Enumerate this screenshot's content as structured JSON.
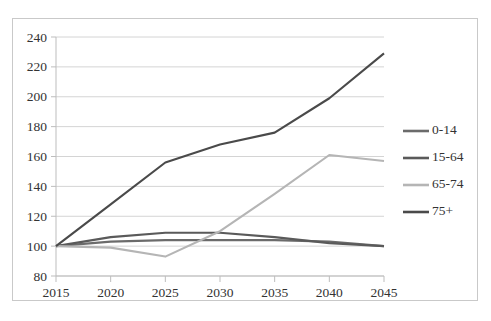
{
  "chart_data": {
    "type": "line",
    "title": "",
    "xlabel": "",
    "ylabel": "",
    "x": [
      2015,
      2020,
      2025,
      2030,
      2035,
      2040,
      2045
    ],
    "categories": [
      "2015",
      "2020",
      "2025",
      "2030",
      "2035",
      "2040",
      "2045"
    ],
    "ylim": [
      80,
      240
    ],
    "yticks": [
      80,
      100,
      120,
      140,
      160,
      180,
      200,
      220,
      240
    ],
    "ytick_labels": [
      "80",
      "100",
      "120",
      "140",
      "160",
      "180",
      "200",
      "220",
      "240"
    ],
    "grid": true,
    "legend_position": "right",
    "series": [
      {
        "name": "0-14",
        "color": "#6b6b6b",
        "values": [
          100,
          103,
          104,
          104,
          104,
          103,
          100
        ]
      },
      {
        "name": "15-64",
        "color": "#5a5a5a",
        "values": [
          100,
          106,
          109,
          109,
          106,
          102,
          100
        ]
      },
      {
        "name": "65-74",
        "color": "#b5b5b5",
        "values": [
          100,
          99,
          93,
          110,
          135,
          161,
          157
        ]
      },
      {
        "name": "75+",
        "color": "#4a4a4a",
        "values": [
          100,
          128,
          156,
          168,
          176,
          199,
          229
        ]
      }
    ]
  },
  "legend": {
    "items": [
      {
        "label": "0-14"
      },
      {
        "label": "15-64"
      },
      {
        "label": "65-74"
      },
      {
        "label": "75+"
      }
    ]
  },
  "caption": {
    "text": ""
  },
  "colors": {
    "grid": "#d4d4d4",
    "axis": "#bdbdbd",
    "text": "#333333",
    "frame": "#c9c9c9"
  }
}
